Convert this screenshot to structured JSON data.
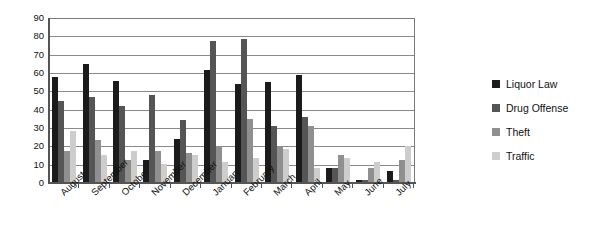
{
  "chart_data": {
    "type": "bar",
    "title": "",
    "xlabel": "",
    "ylabel": "",
    "ylim": [
      0,
      90
    ],
    "ytick_step": 10,
    "yticks": [
      90,
      80,
      70,
      60,
      50,
      40,
      30,
      20,
      10,
      0
    ],
    "grid": true,
    "legend_position": "right",
    "categories": [
      "August",
      "September",
      "October",
      "November",
      "December",
      "January",
      "February",
      "March",
      "April",
      "May",
      "June",
      "July"
    ],
    "series": [
      {
        "name": "Liquor Law",
        "color": "#1b1b1b",
        "values": [
          58,
          65,
          56,
          12,
          24,
          62,
          54,
          55,
          59,
          8,
          1,
          6
        ]
      },
      {
        "name": "Drug Offense",
        "color": "#555555",
        "values": [
          45,
          47,
          42,
          48,
          34,
          78,
          79,
          31,
          36,
          8,
          1,
          1
        ]
      },
      {
        "name": "Theft",
        "color": "#8f8f8f",
        "values": [
          17,
          23,
          12,
          17,
          16,
          20,
          35,
          20,
          31,
          15,
          8,
          12
        ]
      },
      {
        "name": "Traffic",
        "color": "#cdcdcd",
        "values": [
          28,
          15,
          17,
          10,
          15,
          11,
          13,
          18,
          8,
          13,
          11,
          20
        ]
      }
    ]
  },
  "colors": {
    "axis": "#555555",
    "gridline": "#8a8a8a",
    "background": "#ffffff",
    "text": "#111111"
  }
}
